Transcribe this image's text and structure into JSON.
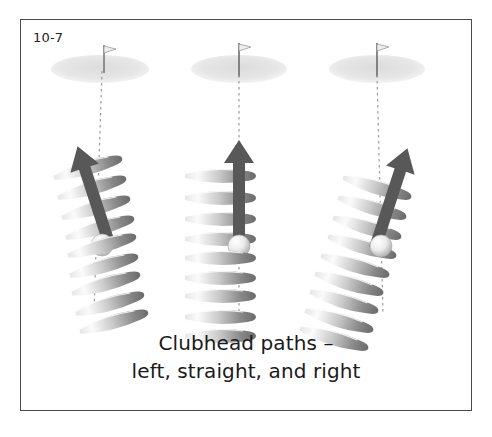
{
  "figure": {
    "label": "10-7",
    "caption_line_1": "Clubhead paths –",
    "caption_line_2": "left, straight, and right"
  },
  "frame": {
    "border_color": "#4a4a4a",
    "background_color": "#ffffff"
  },
  "colors": {
    "arrow": "#5a5a5a",
    "arrow_dark": "#4c4c4c",
    "clubhead_light": "#f2f2f2",
    "clubhead_mid": "#b8b8b8",
    "clubhead_dark": "#6e6e6e",
    "ball_light": "#ffffff",
    "ball_shadow": "#b5b5b5",
    "green": "#e2e2e2",
    "flagstick": "#6b6b6b",
    "target_line": "#9a9a9a",
    "caption_text": "#1a1a1a",
    "label_text": "#222222"
  },
  "panels": [
    {
      "name": "left",
      "path_description": "left",
      "arrow_direction": "up-left",
      "arrow_angle_deg": -18,
      "clubhead_tilt_deg": -18,
      "clubhead_count": 9,
      "green_label": "green",
      "flag_label": "flagstick",
      "ball_label": "golf-ball",
      "target_line_label": "target-line"
    },
    {
      "name": "center",
      "path_description": "straight",
      "arrow_direction": "up",
      "arrow_angle_deg": 0,
      "clubhead_tilt_deg": 0,
      "clubhead_count": 9,
      "green_label": "green",
      "flag_label": "flagstick",
      "ball_label": "golf-ball",
      "target_line_label": "target-line"
    },
    {
      "name": "right",
      "path_description": "right",
      "arrow_direction": "up-right",
      "arrow_angle_deg": 18,
      "clubhead_tilt_deg": 18,
      "clubhead_count": 9,
      "green_label": "green",
      "flag_label": "flagstick",
      "ball_label": "golf-ball",
      "target_line_label": "target-line"
    }
  ]
}
